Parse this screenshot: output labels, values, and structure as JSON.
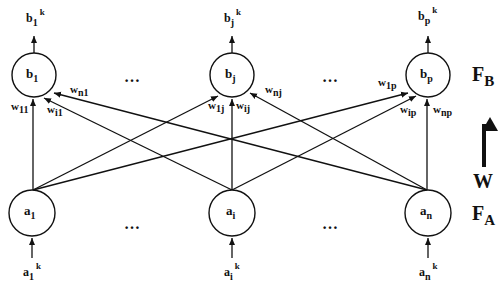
{
  "diagram": {
    "type": "bidirectional-associative-network",
    "colors": {
      "stroke": "#111111",
      "background": "#ffffff"
    },
    "layers": {
      "output_layer": {
        "label": "F",
        "subscript": "B"
      },
      "input_layer": {
        "label": "F",
        "subscript": "A"
      },
      "weight_label": "W",
      "weight_arrow_direction": "up"
    },
    "top_nodes": [
      {
        "id": "b1",
        "base": "b",
        "sub": "1",
        "output": {
          "base": "b",
          "sub": "1",
          "sup": "k"
        }
      },
      {
        "id": "bj",
        "base": "b",
        "sub": "j",
        "output": {
          "base": "b",
          "sub": "j",
          "sup": "k"
        }
      },
      {
        "id": "bp",
        "base": "b",
        "sub": "p",
        "output": {
          "base": "b",
          "sub": "p",
          "sup": "k"
        }
      }
    ],
    "bottom_nodes": [
      {
        "id": "a1",
        "base": "a",
        "sub": "1",
        "input": {
          "base": "a",
          "sub": "1",
          "sup": "k"
        }
      },
      {
        "id": "ai",
        "base": "a",
        "sub": "i",
        "input": {
          "base": "a",
          "sub": "i",
          "sup": "k"
        }
      },
      {
        "id": "an",
        "base": "a",
        "sub": "n",
        "input": {
          "base": "a",
          "sub": "n",
          "sup": "k"
        }
      }
    ],
    "ellipsis": "…",
    "weights": [
      {
        "base": "w",
        "sub": "11",
        "from": "a1",
        "to": "b1"
      },
      {
        "base": "w",
        "sub": "i1",
        "from": "ai",
        "to": "b1"
      },
      {
        "base": "w",
        "sub": "n1",
        "from": "an",
        "to": "b1"
      },
      {
        "base": "w",
        "sub": "1j",
        "from": "a1",
        "to": "bj"
      },
      {
        "base": "w",
        "sub": "ij",
        "from": "ai",
        "to": "bj"
      },
      {
        "base": "w",
        "sub": "nj",
        "from": "an",
        "to": "bj"
      },
      {
        "base": "w",
        "sub": "1p",
        "from": "a1",
        "to": "bp"
      },
      {
        "base": "w",
        "sub": "ip",
        "from": "ai",
        "to": "bp"
      },
      {
        "base": "w",
        "sub": "np",
        "from": "an",
        "to": "bp"
      }
    ]
  }
}
